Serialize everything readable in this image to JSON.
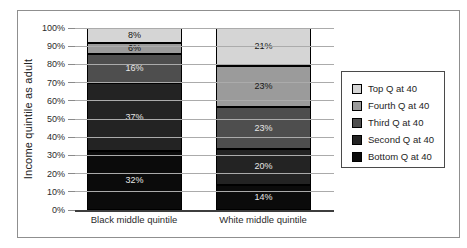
{
  "figure": {
    "background": "#ffffff",
    "frame_border_color": "#8f8f8f",
    "gridline_color": "#ababab",
    "axis_line_color": "#3d3d3d"
  },
  "chart_data": {
    "type": "bar",
    "stacked": true,
    "orientation": "vertical",
    "title": "",
    "xlabel": "",
    "ylabel": "Income quintile as adult",
    "ylim": [
      0,
      100
    ],
    "grid": true,
    "yticks": [
      "0%",
      "10%",
      "20%",
      "30%",
      "40%",
      "50%",
      "60%",
      "70%",
      "80%",
      "90%",
      "100%"
    ],
    "categories": [
      "Black middle quintile",
      "White middle quintile"
    ],
    "series": [
      {
        "name": "Bottom Q at 40",
        "values": [
          32,
          14
        ],
        "color": "#0b0b0b",
        "label_color": "#e6e6e6"
      },
      {
        "name": "Second Q at 40",
        "values": [
          37,
          20
        ],
        "color": "#232323",
        "label_color": "#e6e6e6"
      },
      {
        "name": "Third Q at 40",
        "values": [
          16,
          23
        ],
        "color": "#4e4e4e",
        "label_color": "#e6e6e6"
      },
      {
        "name": "Fourth Q at 40",
        "values": [
          6,
          23
        ],
        "color": "#9b9b9b",
        "label_color": "#161616"
      },
      {
        "name": "Top Q at 40",
        "values": [
          8,
          21
        ],
        "color": "#d5d5d5",
        "label_color": "#161616"
      }
    ],
    "data_labels": "value_percent",
    "legend": {
      "position": "right",
      "entries": [
        "Top Q at 40",
        "Fourth Q at 40",
        "Third Q at 40",
        "Second Q at 40",
        "Bottom Q at 40"
      ]
    }
  }
}
